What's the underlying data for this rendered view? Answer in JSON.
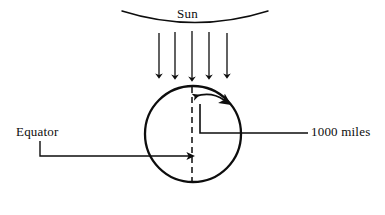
{
  "figure": {
    "background_color": "#ffffff",
    "stroke_color": "#0d0d0d",
    "width": 385,
    "height": 215
  },
  "labels": {
    "sun": "Sun",
    "equator": "Equator",
    "distance": "1000 miles"
  },
  "diagram": {
    "sun_arc": {
      "name": "sun-arc",
      "left_end": [
        122,
        11
      ],
      "right_end": [
        268,
        11
      ],
      "sag_y": 27
    },
    "sun_rays": {
      "name": "sun-ray-arrows",
      "count": 5,
      "x_positions": [
        159,
        175,
        192,
        209,
        227
      ],
      "y_start": 32,
      "y_end": 78,
      "direction": "down"
    },
    "earth": {
      "name": "earth-circle",
      "center": [
        193,
        134
      ],
      "radius": 48
    },
    "meridian": {
      "name": "meridian-dashed-line",
      "x": 192,
      "y_start": 86,
      "y_end": 182,
      "style": "dashed"
    },
    "rotation_arrow": {
      "name": "rotation-double-arrow",
      "start": [
        193,
        96
      ],
      "end": [
        226,
        100
      ],
      "heads": "both",
      "arc": true
    },
    "distance_leader": {
      "name": "distance-leader-line",
      "vertical_x": 200,
      "vertical_y_top": 104,
      "corner_y": 133,
      "horizontal_x_end": 308
    },
    "equator_leader": {
      "name": "equator-leader-line",
      "vertical_x": 40,
      "vertical_y_top": 141,
      "corner_y": 156,
      "arrow_x_end": 191
    }
  }
}
